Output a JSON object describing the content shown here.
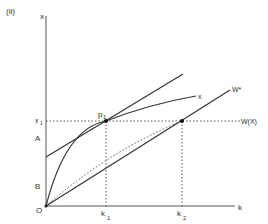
{
  "panel_label": "(ii)",
  "axes": {
    "y_label": "x",
    "x_label": "k",
    "origin_label": "O"
  },
  "y_axis_marks": {
    "x1": "x",
    "x1_sub": "1",
    "A": "A",
    "B": "B"
  },
  "x_axis_marks": {
    "k1": "k",
    "k1_sub": "1",
    "k2": "k",
    "k2_sub": "2"
  },
  "points": {
    "p1": "p",
    "p1_sub": "1"
  },
  "curve_labels": {
    "production_curve": "x",
    "w_star_line": "W*",
    "wx_line": "W(X)"
  }
}
